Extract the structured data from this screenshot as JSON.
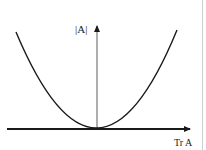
{
  "diagram": {
    "type": "function-plot",
    "y_axis_label": "|A|",
    "x_axis_label": "Tr A",
    "curve": "parabola",
    "colors": {
      "stroke": "#1a1a1a",
      "background": "#ffffff"
    }
  }
}
